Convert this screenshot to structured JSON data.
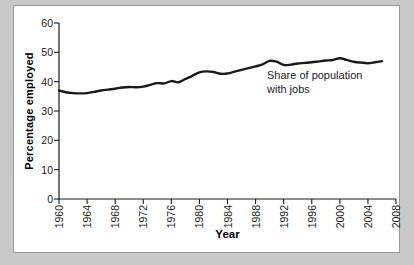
{
  "figure": {
    "frame_color": "#9a9a9a",
    "background_color": "#ffffff",
    "page_background": "#c8c8c8"
  },
  "annotation": {
    "text": "Share of population\nwith jobs"
  },
  "chart_data": {
    "type": "line",
    "title": "",
    "xlabel": "Year",
    "ylabel": "Percentage employed",
    "xlim": [
      1960,
      2008
    ],
    "ylim": [
      0,
      60
    ],
    "grid": false,
    "legend_position": "none",
    "line_color": "#1a1a1a",
    "line_width": 2.4,
    "xticks": [
      1960,
      1964,
      1968,
      1972,
      1976,
      1980,
      1984,
      1988,
      1992,
      1996,
      2000,
      2004,
      2008
    ],
    "xtick_labels": [
      "1960",
      "1964",
      "1968",
      "1972",
      "1976",
      "1980",
      "1984",
      "1988",
      "1992",
      "1996",
      "2000",
      "2004",
      "2008"
    ],
    "yticks": [
      0,
      10,
      20,
      30,
      40,
      50,
      60
    ],
    "ytick_labels": [
      "0",
      "10",
      "20",
      "30",
      "40",
      "50",
      "60"
    ],
    "series": [
      {
        "name": "Share of population with jobs",
        "x": [
          1960,
          1961,
          1962,
          1963,
          1964,
          1965,
          1966,
          1967,
          1968,
          1969,
          1970,
          1971,
          1972,
          1973,
          1974,
          1975,
          1976,
          1977,
          1978,
          1979,
          1980,
          1981,
          1982,
          1983,
          1984,
          1985,
          1986,
          1987,
          1988,
          1989,
          1990,
          1991,
          1992,
          1993,
          1994,
          1995,
          1996,
          1997,
          1998,
          1999,
          2000,
          2001,
          2002,
          2003,
          2004,
          2005,
          2006
        ],
        "values": [
          37.0,
          36.4,
          36.1,
          36.0,
          36.1,
          36.5,
          37.0,
          37.3,
          37.6,
          38.0,
          38.2,
          38.1,
          38.3,
          38.9,
          39.5,
          39.4,
          40.2,
          39.8,
          40.9,
          42.0,
          43.2,
          43.5,
          43.3,
          42.7,
          42.8,
          43.4,
          44.0,
          44.6,
          45.2,
          45.9,
          47.1,
          46.8,
          45.7,
          45.8,
          46.2,
          46.4,
          46.6,
          46.9,
          47.2,
          47.4,
          48.0,
          47.4,
          46.8,
          46.5,
          46.3,
          46.6,
          47.0
        ]
      }
    ]
  }
}
